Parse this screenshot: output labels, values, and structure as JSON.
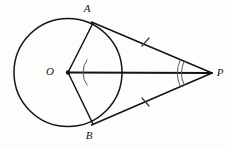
{
  "figure": {
    "stroke_color": "#141414",
    "mark_color": "#3a3a3a",
    "arc_color": "#4a4a4a",
    "background": "#fdfdfc",
    "labels": {
      "center": "O",
      "tangent_point_top": "A",
      "tangent_point_bottom": "B",
      "external_point": "P"
    },
    "points": {
      "O": {
        "x": 68,
        "y": 72.5
      },
      "A": {
        "x": 93,
        "y": 23
      },
      "B": {
        "x": 93,
        "y": 124
      },
      "P": {
        "x": 212,
        "y": 73
      }
    },
    "label_positions": {
      "O": {
        "x": 50,
        "y": 72
      },
      "A": {
        "x": 87,
        "y": 9
      },
      "B": {
        "x": 89,
        "y": 136
      },
      "P": {
        "x": 220,
        "y": 73
      }
    },
    "circle": {
      "cx": 68,
      "cy": 72.5,
      "r": 54
    },
    "segments": [
      {
        "name": "OA",
        "from": "O",
        "to": "A"
      },
      {
        "name": "OB",
        "from": "O",
        "to": "B"
      },
      {
        "name": "OP",
        "from": "O",
        "to": "P"
      },
      {
        "name": "PA",
        "from": "P",
        "to": "A"
      },
      {
        "name": "PB",
        "from": "P",
        "to": "B"
      }
    ],
    "congruence_ticks": [
      {
        "name": "tick-PA",
        "x": 145,
        "y": 42,
        "count": 1
      },
      {
        "name": "tick-PB",
        "x": 145,
        "y": 102,
        "count": 1
      }
    ],
    "angle_marks": [
      {
        "name": "angle-AOB",
        "vertex": "O",
        "radius": 22,
        "count": 1
      },
      {
        "name": "angle-APB",
        "vertex": "P",
        "radius": 32,
        "count": 2
      }
    ]
  }
}
